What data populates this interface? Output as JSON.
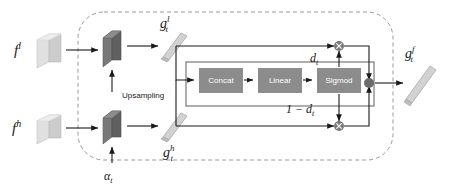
{
  "figure": {
    "type": "block-diagram",
    "canvas": {
      "width": 450,
      "height": 187,
      "background": "#ffffff"
    }
  },
  "colors": {
    "block_fill": "#8c8c8c",
    "block_text": "#ffffff",
    "arrow": "#1a1a1a",
    "dashed_border": "#9a9a9a",
    "inner_border": "#4d4d4d",
    "slab_light_face": "#d4d4d4",
    "slab_light_side": "#b5b5b5",
    "slab_light_top": "#e6e6e6",
    "slab_dark_face": "#6e6e6e",
    "slab_dark_side": "#575757",
    "slab_dark_top": "#8a8a8a",
    "bar_fill": "#cfcfcf",
    "bar_edge": "#9c9c9c",
    "node_fill": "#7a7a7a",
    "sum_node_fill": "#6b6b6b"
  },
  "inputs": {
    "low_level": {
      "label": "f",
      "superscript": "l",
      "name": "f^l"
    },
    "high_level": {
      "label": "f",
      "superscript": "h",
      "name": "f^h"
    },
    "alpha": {
      "label": "α",
      "subscript": "t",
      "name": "alpha_t"
    }
  },
  "operations": {
    "upsampling": {
      "label": "Upsampling"
    },
    "concat": {
      "label": "Concat"
    },
    "linear": {
      "label": "Linear"
    },
    "sigmoid": {
      "label": "Sigmod"
    },
    "multiply_symbol": "×",
    "multiply_top_name": "multiply-dt",
    "multiply_bottom_name": "multiply-one-minus-dt",
    "sum_name": "sum-node"
  },
  "gates": {
    "d_t": {
      "label": "d",
      "subscript": "t",
      "name": "d_t"
    },
    "one_minus_d_t": {
      "label": "1 − d",
      "subscript": "t",
      "name": "1-d_t"
    }
  },
  "features": {
    "g_low": {
      "label": "g",
      "subscript": "t",
      "superscript": "l",
      "name": "g_t^l"
    },
    "g_high": {
      "label": "g",
      "subscript": "t",
      "superscript": "h",
      "name": "g_t^h"
    },
    "g_fused": {
      "label": "g",
      "subscript": "t",
      "superscript": "f",
      "name": "g_t^f"
    }
  },
  "flow": {
    "nodes": [
      "f^l",
      "f^h",
      "alpha_t",
      "Upsampling",
      "g_t^l",
      "g_t^h",
      "Concat",
      "Linear",
      "Sigmod",
      "d_t",
      "1-d_t",
      "multiply-dt",
      "multiply-one-minus-dt",
      "sum-node",
      "g_t^f"
    ],
    "edges": [
      "f^l -> upsampled-low",
      "f^h -> modulated-high",
      "alpha_t -> upsampled-low",
      "alpha_t -> modulated-high",
      "upsampled-low -> g_t^l",
      "modulated-high -> g_t^h",
      "g_t^l -> Concat",
      "g_t^h -> Concat",
      "Concat -> Linear",
      "Linear -> Sigmod",
      "Sigmod -> d_t",
      "Sigmod -> 1-d_t",
      "g_t^l -> multiply-dt",
      "d_t -> multiply-dt",
      "g_t^h -> multiply-one-minus-dt",
      "1-d_t -> multiply-one-minus-dt",
      "multiply-dt -> sum-node",
      "multiply-one-minus-dt -> sum-node",
      "sum-node -> g_t^f"
    ]
  }
}
